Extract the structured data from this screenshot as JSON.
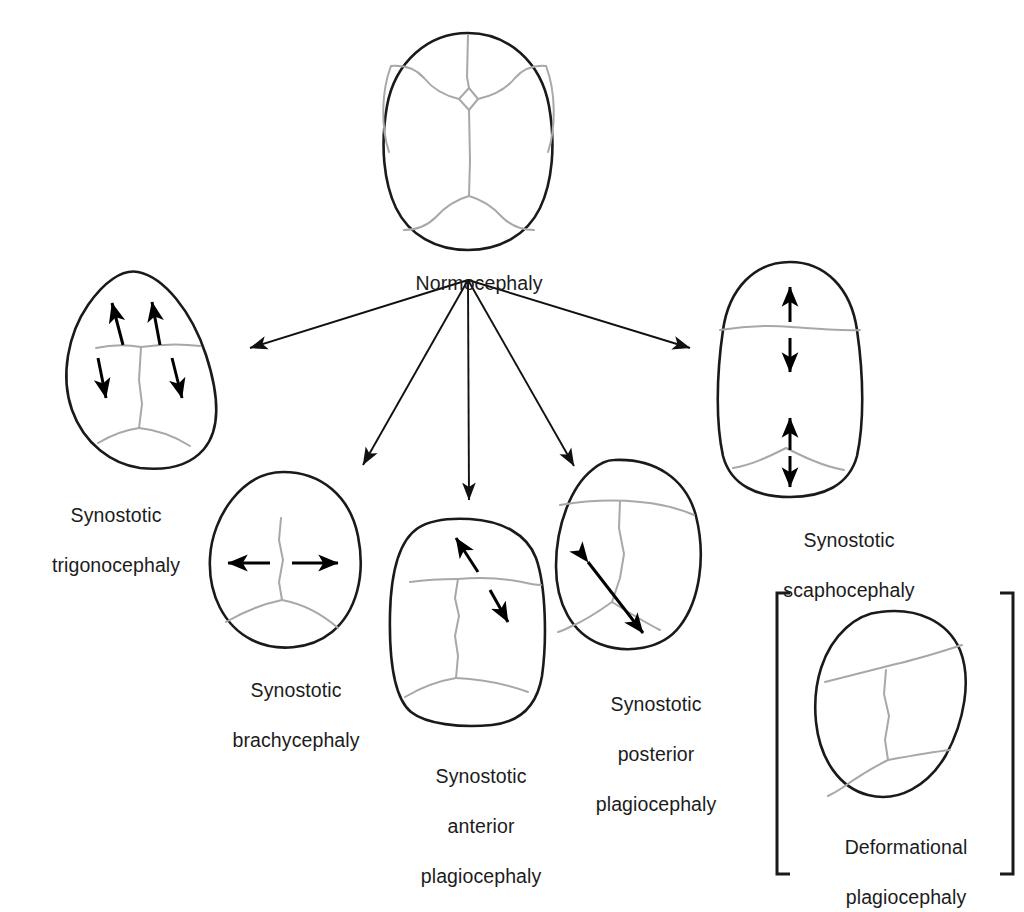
{
  "figure": {
    "kind": "medical-diagram",
    "background_color": "#ffffff",
    "outline_color": "#1a1a1a",
    "suture_color": "#a8a8a8",
    "arrow_color": "#000000"
  },
  "root_node": {
    "label": "Normocephaly",
    "sutures": [
      "metopic",
      "coronal-left",
      "coronal-right",
      "sagittal",
      "lambdoid-left",
      "lambdoid-right",
      "anterior-fontanelle",
      "posterior-fontanelle"
    ]
  },
  "flow": {
    "origin_label": "Normocephaly",
    "branch_count": 5,
    "targets": [
      "Synostotic trigonocephaly",
      "Synostotic brachycephaly",
      "Synostotic anterior plagiocephaly",
      "Synostotic posterior plagiocephaly",
      "Synostotic scaphocephaly"
    ]
  },
  "nodes": [
    {
      "id": "trigonocephaly",
      "caption_lines": [
        "Synostotic",
        "trigonocephaly"
      ],
      "fused_suture": "metopic",
      "shape": "triangular / teardrop, narrow forehead",
      "growth_arrows": 4,
      "arrow_style": "single-headed, two up-lateral and two down-lateral"
    },
    {
      "id": "brachycephaly",
      "caption_lines": [
        "Synostotic",
        "brachycephaly"
      ],
      "fused_suture": "bilateral coronal",
      "shape": "short and wide, rounded",
      "growth_arrows": 1,
      "arrow_style": "double-headed horizontal"
    },
    {
      "id": "anterior-plagiocephaly",
      "caption_lines": [
        "Synostotic",
        "anterior",
        "plagiocephaly"
      ],
      "fused_suture": "unilateral coronal",
      "shape": "asymmetric, flattened right forehead",
      "growth_arrows": 2,
      "arrow_style": "two single-headed oblique, opposed"
    },
    {
      "id": "posterior-plagiocephaly",
      "caption_lines": [
        "Synostotic",
        "posterior",
        "plagiocephaly"
      ],
      "fused_suture": "unilateral lambdoid",
      "shape": "trapezoidal, flattened left occiput",
      "growth_arrows": 1,
      "arrow_style": "double-headed oblique"
    },
    {
      "id": "scaphocephaly",
      "caption_lines": [
        "Synostotic",
        "scaphocephaly"
      ],
      "fused_suture": "sagittal",
      "shape": "long and narrow oval",
      "growth_arrows": 2,
      "arrow_style": "two double-headed vertical"
    },
    {
      "id": "deformational-plagiocephaly",
      "caption_lines": [
        "Deformational",
        "plagiocephaly"
      ],
      "fused_suture": "none (patent sutures)",
      "shape": "parallelogram",
      "growth_arrows": 0,
      "arrow_style": "none",
      "enclosed_in_brackets": true
    }
  ],
  "captions": {
    "normocephaly": "Normocephaly",
    "trigonocephaly_l1": "Synostotic",
    "trigonocephaly_l2": "trigonocephaly",
    "brachycephaly_l1": "Synostotic",
    "brachycephaly_l2": "brachycephaly",
    "anterior_l1": "Synostotic",
    "anterior_l2": "anterior",
    "anterior_l3": "plagiocephaly",
    "posterior_l1": "Synostotic",
    "posterior_l2": "posterior",
    "posterior_l3": "plagiocephaly",
    "scaphocephaly_l1": "Synostotic",
    "scaphocephaly_l2": "scaphocephaly",
    "deformational_l1": "Deformational",
    "deformational_l2": "plagiocephaly"
  }
}
